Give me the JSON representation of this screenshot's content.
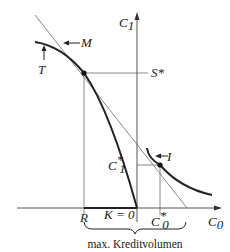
{
  "diagram": {
    "axes": {
      "y_label": "C",
      "y_label_sub": "1",
      "x_label": "C",
      "x_label_sub": "0"
    },
    "curves": {
      "transformation_curve": "T",
      "market_line": "M",
      "indifference_curve": "I"
    },
    "points": {
      "s_star": "S*",
      "c1_star": "C",
      "c1_star_sub": "1",
      "c1_star_sup": "*",
      "c0_star": "C",
      "c0_star_sub": "0",
      "c0_star_sup": "*",
      "r": "R",
      "k_zero": "K = 0"
    },
    "brace_caption": "max. Kreditvolumen",
    "colors": {
      "curve": "#222222",
      "thin_line": "#888888",
      "axis": "#555555"
    }
  }
}
